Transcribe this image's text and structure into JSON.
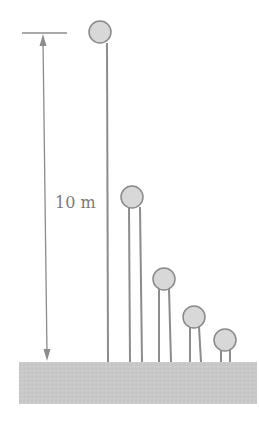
{
  "diagram": {
    "title": "",
    "height_label": "10 m",
    "colors": {
      "line": "#8c8c8c",
      "ball_fill": "#d8d8d8",
      "ball_stroke": "#8a8a8a",
      "ground": "#c9c9c9",
      "label": "#7a7a7a"
    },
    "dimension": {
      "top_tick": {
        "x1": 22,
        "x2": 67,
        "y": 33
      },
      "arrow": {
        "x_top": 43,
        "y_top": 33,
        "x_bottom": 47,
        "y_bottom": 361
      }
    },
    "ground": {
      "x": 19,
      "y": 362,
      "width": 238,
      "height": 42
    },
    "balls": [
      {
        "cx": 100,
        "cy": 32,
        "r": 11,
        "posts": [
          107
        ]
      },
      {
        "cx": 132,
        "cy": 197,
        "r": 11,
        "posts": [
          129,
          141
        ]
      },
      {
        "cx": 164,
        "cy": 279,
        "r": 11,
        "posts": [
          159,
          170
        ]
      },
      {
        "cx": 194,
        "cy": 317,
        "r": 11,
        "posts": [
          190,
          201
        ]
      },
      {
        "cx": 225,
        "cy": 340,
        "r": 11,
        "posts": [
          221,
          230
        ]
      }
    ]
  }
}
